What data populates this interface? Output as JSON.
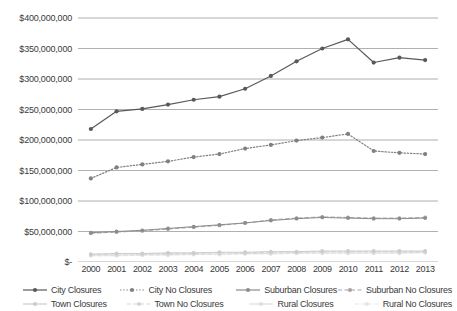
{
  "chart_data": {
    "type": "line",
    "title": "",
    "xlabel": "",
    "ylabel": "",
    "grid": true,
    "legend_position": "bottom",
    "ylim": [
      0,
      400000000
    ],
    "ytick_labels": [
      "$400,000,000",
      "$350,000,000",
      "$300,000,000",
      "$250,000,000",
      "$200,000,000",
      "$150,000,000",
      "$100,000,000",
      "$50,000,000",
      "$-"
    ],
    "ytick_values": [
      400000000,
      350000000,
      300000000,
      250000000,
      200000000,
      150000000,
      100000000,
      50000000,
      0
    ],
    "categories": [
      "2000",
      "2001",
      "2002",
      "2003",
      "2004",
      "2005",
      "2006",
      "2007",
      "2008",
      "2009",
      "2010",
      "2011",
      "2012",
      "2013"
    ],
    "series": [
      {
        "name": "City Closures",
        "color": "#595959",
        "style": "solid",
        "marker": "circle",
        "values": [
          218000000,
          247000000,
          251000000,
          258000000,
          266000000,
          271000000,
          284000000,
          305000000,
          329000000,
          350000000,
          365000000,
          327000000,
          335000000,
          331000000
        ]
      },
      {
        "name": "City No Closures",
        "color": "#808080",
        "style": "dotted",
        "marker": "circle",
        "values": [
          137000000,
          155000000,
          160000000,
          165000000,
          172000000,
          177000000,
          186000000,
          192000000,
          199000000,
          204000000,
          210000000,
          182000000,
          179000000,
          177000000
        ]
      },
      {
        "name": "Suburban Closures",
        "color": "#8c8c8c",
        "style": "solid",
        "marker": "circle",
        "values": [
          48000000,
          50000000,
          52000000,
          55000000,
          58000000,
          61000000,
          64000000,
          68000000,
          71000000,
          73000000,
          72000000,
          71000000,
          71000000,
          72000000
        ]
      },
      {
        "name": "Suburban No Closures",
        "color": "#a6a6a6",
        "style": "dashed",
        "marker": "circle",
        "values": [
          47000000,
          49000000,
          51000000,
          54000000,
          57000000,
          60000000,
          64000000,
          69000000,
          72000000,
          74000000,
          73000000,
          72000000,
          72000000,
          73000000
        ]
      },
      {
        "name": "Town Closures",
        "color": "#cccccc",
        "style": "solid",
        "marker": "circle",
        "values": [
          13000000,
          14000000,
          14000000,
          15000000,
          15000000,
          16000000,
          16000000,
          17000000,
          17000000,
          18000000,
          18000000,
          18000000,
          18000000,
          18000000
        ]
      },
      {
        "name": "Town No Closures",
        "color": "#d4d4d4",
        "style": "dashed",
        "marker": "circle",
        "values": [
          12000000,
          13000000,
          13000000,
          14000000,
          14000000,
          15000000,
          15000000,
          16000000,
          16000000,
          17000000,
          17000000,
          17000000,
          17000000,
          17000000
        ]
      },
      {
        "name": "Rural Closures",
        "color": "#dedede",
        "style": "solid",
        "marker": "circle",
        "values": [
          11000000,
          11000000,
          12000000,
          12000000,
          13000000,
          13000000,
          14000000,
          14000000,
          15000000,
          15000000,
          15000000,
          15000000,
          15000000,
          16000000
        ]
      },
      {
        "name": "Rural No Closures",
        "color": "#e6e6e6",
        "style": "dashed",
        "marker": "circle",
        "values": [
          10000000,
          10000000,
          11000000,
          11000000,
          12000000,
          12000000,
          13000000,
          13000000,
          14000000,
          14000000,
          14000000,
          14000000,
          14000000,
          15000000
        ]
      }
    ]
  },
  "legend": {
    "row1": [
      {
        "label": "City Closures",
        "series": 0
      },
      {
        "label": "City No Closures",
        "series": 1
      },
      {
        "label": "Suburban Closures",
        "series": 2
      },
      {
        "label": "Suburban No Closures",
        "series": 3
      }
    ],
    "row2": [
      {
        "label": "Town Closures",
        "series": 4
      },
      {
        "label": "Town No Closures",
        "series": 5
      },
      {
        "label": "Rural Closures",
        "series": 6
      },
      {
        "label": "Rural No Closures",
        "series": 7
      }
    ]
  },
  "colors": {
    "gridline": "#8c8c8c",
    "gridline_light": "#bfbfbf",
    "text": "#3a3a3a",
    "background": "#ffffff"
  }
}
